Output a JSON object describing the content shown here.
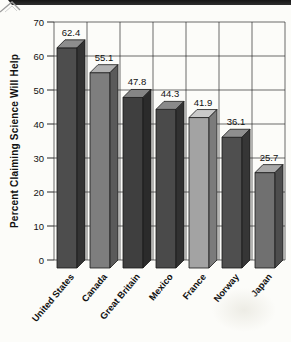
{
  "page": {
    "top_bar_color": "#1f1f1f",
    "background": "#fcfcf9",
    "decoration": "mountain-outline"
  },
  "chart_data": {
    "type": "bar",
    "title": "",
    "xlabel": "",
    "ylabel": "Percent Claiming Science Will Help",
    "categories": [
      "United States",
      "Canada",
      "Great Britain",
      "Mexico",
      "France",
      "Norway",
      "Japan"
    ],
    "values": [
      62.4,
      55.1,
      47.8,
      44.3,
      41.9,
      36.1,
      25.7
    ],
    "value_labels": [
      "62.4",
      "55.1",
      "47.8",
      "44.3",
      "41.9",
      "36.1",
      "25.7"
    ],
    "ylim": [
      0,
      70
    ],
    "yticks": [
      0,
      10,
      20,
      30,
      40,
      50,
      60,
      70
    ],
    "grid": true,
    "legend": "none",
    "style": "3d-column",
    "grid_color": "#2b2b2b",
    "text_color": "#111111",
    "bar_styles": [
      {
        "front": "#4d4d4d",
        "top": "#8d8d8d",
        "side": "#333333"
      },
      {
        "front": "#7e7e7e",
        "top": "#b2b2b2",
        "side": "#5a5a5a"
      },
      {
        "front": "#3f3f3f",
        "top": "#858585",
        "side": "#2b2b2b"
      },
      {
        "front": "#4a4a4a",
        "top": "#8a8a8a",
        "side": "#313131"
      },
      {
        "front": "#a3a3a3",
        "top": "#c9c9c9",
        "side": "#7b7b7b"
      },
      {
        "front": "#4f4f4f",
        "top": "#8f8f8f",
        "side": "#363636"
      },
      {
        "front": "#707070",
        "top": "#a8a8a8",
        "side": "#4d4d4d"
      }
    ]
  }
}
